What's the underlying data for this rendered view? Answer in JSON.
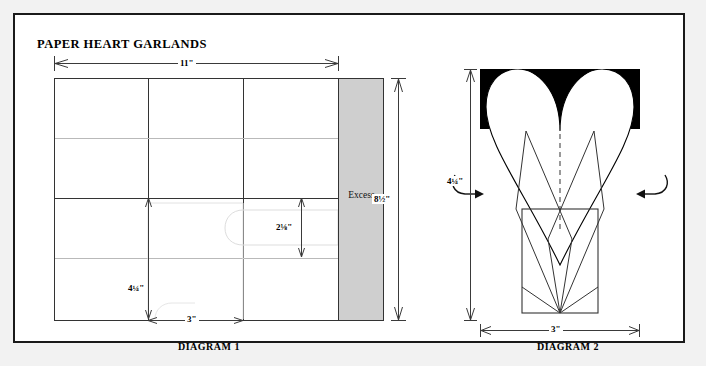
{
  "page": {
    "title": "PAPER HEART GARLANDS",
    "background_color": "#f2f2f2",
    "frame_color": "#1a1a1a"
  },
  "diagram1": {
    "caption": "DIAGRAM 1",
    "excess_label": "Excess",
    "excess_fill": "#cfcfcf",
    "dimensions": {
      "width_total": "11\"",
      "height_total": "8½\"",
      "cell_width": "3\"",
      "cell_height": "4¼\"",
      "strip_height": "2⅛\""
    },
    "columns": 3,
    "rows": 4
  },
  "diagram2": {
    "caption": "DIAGRAM 2",
    "dimensions": {
      "height": "4¼\"",
      "width": "3\""
    },
    "center_line": "dashed",
    "arrows": [
      "fold-arrow-left",
      "fold-arrow-right"
    ],
    "heart_fill": "#ffffff",
    "background_fill": "#000000"
  }
}
